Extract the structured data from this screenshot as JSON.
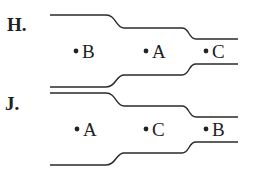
{
  "diagrams": [
    {
      "label": "H.",
      "points": [
        {
          "name": "B",
          "x": 74,
          "y": 52
        },
        {
          "name": "A",
          "x": 145,
          "y": 52
        },
        {
          "name": "C",
          "x": 205,
          "y": 52
        }
      ]
    },
    {
      "label": "J.",
      "points": [
        {
          "name": "A",
          "x": 76,
          "y": 130
        },
        {
          "name": "C",
          "x": 146,
          "y": 130
        },
        {
          "name": "B",
          "x": 205,
          "y": 130
        }
      ]
    }
  ]
}
